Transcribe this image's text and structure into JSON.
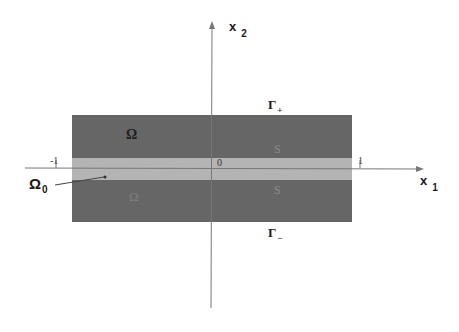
{
  "figure": {
    "axes": {
      "x1_label": "x",
      "x1_subscript": "1",
      "x2_label": "x",
      "x2_subscript": "2"
    },
    "ticks": {
      "left": "-1",
      "origin": "0",
      "right": "1"
    },
    "boundaries": {
      "top_label": "Γ",
      "top_subscript": "+",
      "bottom_label": "Γ",
      "bottom_subscript": "−"
    },
    "regions": {
      "upper_label": "Ω",
      "lower_label": "Ω",
      "upper_interface_label": "S",
      "lower_interface_label": "S",
      "layer_label": "Ω",
      "layer_subscript": "0"
    },
    "colors": {
      "background": "#ffffff",
      "outer_region": "#666666",
      "layer": "#b4b4b4",
      "axis": "#777777",
      "text": "#1a1a1a"
    },
    "geometry": {
      "rect": {
        "x": 72,
        "y": 115,
        "width": 280,
        "height": 107
      },
      "layer": {
        "y": 158,
        "height": 22
      },
      "x1_axis_y": 168,
      "x2_axis_x": 212
    }
  }
}
